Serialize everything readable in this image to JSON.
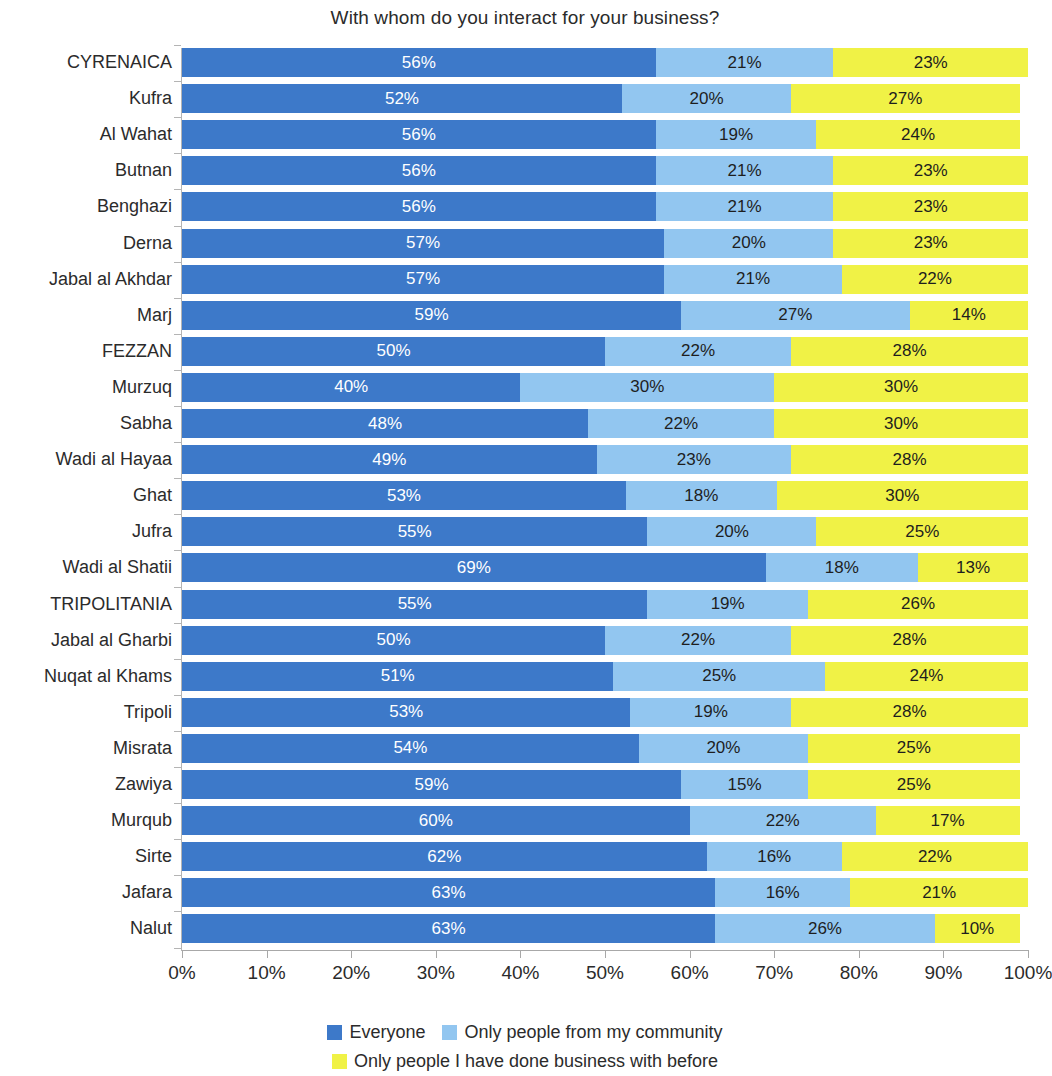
{
  "chart_data": {
    "type": "bar",
    "subtype": "stacked-horizontal-100",
    "title": "With whom do you interact for your business?",
    "xlabel": "",
    "ylabel": "",
    "xlim": [
      0,
      100
    ],
    "xticks": [
      "0%",
      "10%",
      "20%",
      "30%",
      "40%",
      "50%",
      "60%",
      "70%",
      "80%",
      "90%",
      "100%"
    ],
    "xtick_values": [
      0,
      10,
      20,
      30,
      40,
      50,
      60,
      70,
      80,
      90,
      100
    ],
    "grid": false,
    "legend_position": "bottom",
    "legend": [
      "Everyone",
      "Only people from my community",
      "Only people I have done business with before"
    ],
    "colors": {
      "everyone": "#3d79c9",
      "community": "#92c6f0",
      "previous_business": "#f0f246"
    },
    "categories": [
      "CYRENAICA",
      "Kufra",
      "Al Wahat",
      "Butnan",
      "Benghazi",
      "Derna",
      "Jabal al Akhdar",
      "Marj",
      "FEZZAN",
      "Murzuq",
      "Sabha",
      "Wadi al Hayaa",
      "Ghat",
      "Jufra",
      "Wadi al Shatii",
      "TRIPOLITANIA",
      "Jabal al Gharbi",
      "Nuqat al Khams",
      "Tripoli",
      "Misrata",
      "Zawiya",
      "Murqub",
      "Sirte",
      "Jafara",
      "Nalut"
    ],
    "series": [
      {
        "name": "Everyone",
        "color": "#3d79c9",
        "values": [
          56,
          52,
          56,
          56,
          56,
          57,
          57,
          59,
          50,
          40,
          48,
          49,
          53,
          55,
          69,
          55,
          50,
          51,
          53,
          54,
          59,
          60,
          62,
          63,
          63
        ]
      },
      {
        "name": "Only people from my community",
        "color": "#92c6f0",
        "values": [
          21,
          20,
          19,
          21,
          21,
          20,
          21,
          27,
          22,
          30,
          22,
          23,
          18,
          20,
          18,
          19,
          22,
          25,
          19,
          20,
          15,
          22,
          16,
          16,
          26
        ]
      },
      {
        "name": "Only people I have done business with before",
        "color": "#f0f246",
        "values": [
          23,
          27,
          24,
          23,
          23,
          23,
          22,
          14,
          28,
          30,
          30,
          28,
          30,
          25,
          13,
          26,
          28,
          24,
          28,
          25,
          25,
          17,
          22,
          21,
          10
        ]
      }
    ],
    "labels": [
      [
        "56%",
        "21%",
        "23%"
      ],
      [
        "52%",
        "20%",
        "27%"
      ],
      [
        "56%",
        "19%",
        "24%"
      ],
      [
        "56%",
        "21%",
        "23%"
      ],
      [
        "56%",
        "21%",
        "23%"
      ],
      [
        "57%",
        "20%",
        "23%"
      ],
      [
        "57%",
        "21%",
        "22%"
      ],
      [
        "59%",
        "27%",
        "14%"
      ],
      [
        "50%",
        "22%",
        "28%"
      ],
      [
        "40%",
        "30%",
        "30%"
      ],
      [
        "48%",
        "22%",
        "30%"
      ],
      [
        "49%",
        "23%",
        "28%"
      ],
      [
        "53%",
        "18%",
        "30%"
      ],
      [
        "55%",
        "20%",
        "25%"
      ],
      [
        "69%",
        "18%",
        "13%"
      ],
      [
        "55%",
        "19%",
        "26%"
      ],
      [
        "50%",
        "22%",
        "28%"
      ],
      [
        "51%",
        "25%",
        "24%"
      ],
      [
        "53%",
        "19%",
        "28%"
      ],
      [
        "54%",
        "20%",
        "25%"
      ],
      [
        "59%",
        "15%",
        "25%"
      ],
      [
        "60%",
        "22%",
        "17%"
      ],
      [
        "62%",
        "16%",
        "22%"
      ],
      [
        "63%",
        "16%",
        "21%"
      ],
      [
        "63%",
        "26%",
        "10%"
      ]
    ]
  }
}
